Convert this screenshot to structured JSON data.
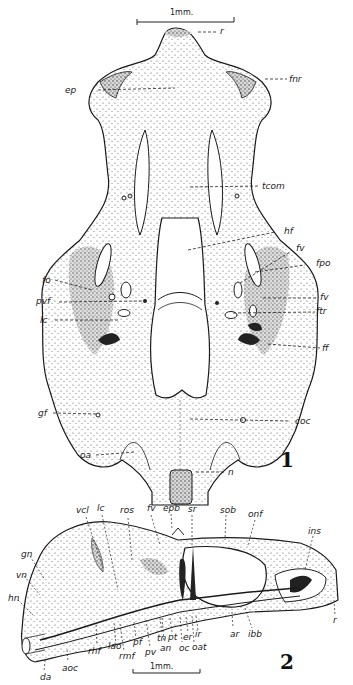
{
  "plate": {
    "figures": [
      {
        "number": "1",
        "view": "ventral",
        "scale_bar": "1mm.",
        "labels": {
          "r": "r",
          "fnr": "fnr",
          "ep": "ep",
          "tcom": "tcom",
          "hf": "hf",
          "fv_upper": "fv",
          "fpo": "fpo",
          "fo": "fo",
          "pvf": "pvf",
          "fv_lower": "fv",
          "ftr": "ftr",
          "lc": "lc",
          "ff": "ff",
          "gf": "gf",
          "coc": "coc",
          "oa": "oa",
          "n": "n"
        }
      },
      {
        "number": "2",
        "view": "lateral",
        "scale_bar": "1mm.",
        "labels": {
          "vcl": "vcl",
          "lc": "lc",
          "ros": "ros",
          "fv": "fv",
          "epb": "epb",
          "sr": "sr",
          "sob": "sob",
          "onf": "onf",
          "ins": "ins",
          "gn": "gn",
          "vn": "vn",
          "hn": "hn",
          "da": "da",
          "aoc": "aoc",
          "rhf": "rhf",
          "lao": "lao",
          "rmf": "rmf",
          "pf": "pf",
          "pv": "pv",
          "tn": "tn",
          "an": "an",
          "pt": "pt",
          "oc": "oc",
          "er": "er",
          "ir": "ir",
          "oat": "oat",
          "ar": "ar",
          "ibb": "ibb",
          "r": "r"
        }
      }
    ]
  },
  "colors": {
    "ink": "#1a1a1a",
    "stipple": "#9a9a9a",
    "paper": "#ffffff"
  }
}
